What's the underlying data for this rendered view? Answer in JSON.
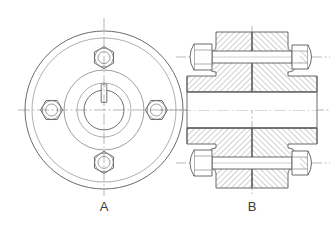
{
  "drawing": {
    "title": "Flange Coupling Engineering Drawing",
    "background_color": "#ffffff",
    "line_color": "#555555",
    "centerline_color": "#8a8a8a",
    "hatch_color": "#7a7a7a",
    "views": [
      {
        "id": "front-view",
        "label": "A",
        "label_x": 104,
        "label_y": 209,
        "type": "front elevation",
        "description": "Circular flange face with four hexagonal bolt heads on a bolt circle, central shaft bore with keyway at top",
        "center": {
          "x": 104,
          "y": 110
        },
        "circles": [
          {
            "name": "outer-rim-outer",
            "r": 79
          },
          {
            "name": "outer-rim-inner",
            "r": 72
          },
          {
            "name": "hub-outer",
            "r": 40
          },
          {
            "name": "hub-inner",
            "r": 27
          },
          {
            "name": "shaft-bore",
            "r": 20
          }
        ],
        "bolt_circle_radius": 53,
        "bolt_head_across_flats": 9,
        "bolt_washer_radius": 11,
        "bolt_inner_radius": 6,
        "bolt_positions": [
          {
            "name": "bolt-top",
            "angle_deg": 270
          },
          {
            "name": "bolt-right",
            "angle_deg": 0
          },
          {
            "name": "bolt-bottom",
            "angle_deg": 90
          },
          {
            "name": "bolt-left",
            "angle_deg": 180
          }
        ],
        "keyway": {
          "name": "keyway-slot",
          "width": 6,
          "depth": 8,
          "position": "top"
        }
      },
      {
        "id": "section-view",
        "label": "B",
        "label_x": 252,
        "label_y": 209,
        "type": "sectional side elevation",
        "description": "Half-section through flange coupling showing two mating hubs bolted together, hatched cut material, hex bolts with nuts top and bottom",
        "center": {
          "x": 252,
          "y": 110
        },
        "hub_half_height": 79,
        "hub_body_half_height": 40,
        "flange_width": 74,
        "bore_half_height": 20,
        "bolts": [
          {
            "name": "bolt-upper",
            "y_offset": -57
          },
          {
            "name": "bolt-lower",
            "y_offset": 57
          }
        ]
      }
    ],
    "centerlines": [
      {
        "name": "front-view-horizontal-centerline",
        "orientation": "horizontal"
      },
      {
        "name": "front-view-vertical-centerline",
        "orientation": "vertical"
      },
      {
        "name": "section-view-horizontal-centerline",
        "orientation": "horizontal"
      },
      {
        "name": "section-view-vertical-centerline",
        "orientation": "vertical"
      },
      {
        "name": "section-bolt-upper-centerline",
        "orientation": "horizontal"
      },
      {
        "name": "section-bolt-lower-centerline",
        "orientation": "horizontal"
      }
    ]
  }
}
